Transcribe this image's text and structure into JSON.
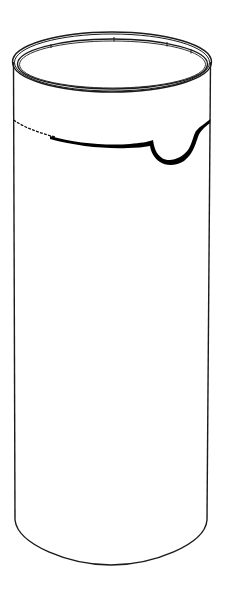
{
  "illustration": {
    "subject": "cylindrical container with torn band",
    "stroke_color": "#1a1a1a",
    "fill_color": "#000000",
    "background": "#ffffff"
  }
}
